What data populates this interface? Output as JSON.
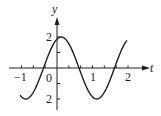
{
  "chart_data": {
    "type": "line",
    "title": "",
    "xlabel": "t",
    "ylabel": "y",
    "xlim": [
      -1.35,
      2.6
    ],
    "ylim": [
      -2.5,
      3.3
    ],
    "x_tick_labels": [
      "−1",
      "0",
      "1",
      "2"
    ],
    "x_tick_values": [
      -1,
      0,
      1,
      2
    ],
    "x_minor_tick_step": 0.3333,
    "y_tick_labels": [
      "2",
      "2"
    ],
    "y_tick_values": [
      2,
      -2
    ],
    "y_minor_ticks": [
      1,
      -1
    ],
    "grid": false,
    "legend": null,
    "series": [
      {
        "name": "y(t)",
        "description": "sinusoid with amplitude 2 and period 2, peak near t≈0.12",
        "formula_estimate": "y = 2 cos(π(t − 0.12))",
        "x": [
          -1.04,
          -0.88,
          -0.63,
          -0.38,
          -0.13,
          0.12,
          0.37,
          0.62,
          0.87,
          1.12,
          1.37,
          1.62,
          1.87,
          1.97
        ],
        "y": [
          -1.75,
          -2.0,
          -1.41,
          0.0,
          1.41,
          2.0,
          1.41,
          0.0,
          -1.41,
          -2.0,
          -1.41,
          0.0,
          1.41,
          1.78
        ]
      }
    ],
    "color": "#231f20"
  },
  "labels": {
    "x_axis": "t",
    "y_axis": "y",
    "x_neg1": "−1",
    "x_zero": "0",
    "x_one": "1",
    "x_two": "2",
    "y_two": "2",
    "y_neg_two": "2"
  }
}
